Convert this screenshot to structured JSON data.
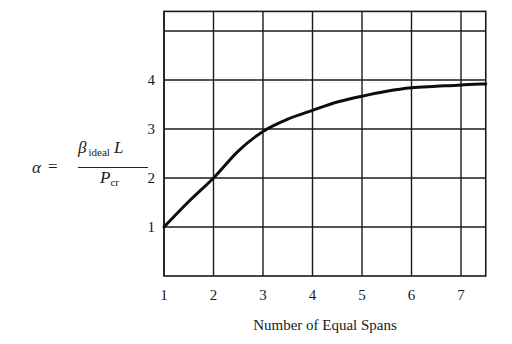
{
  "chart_data": {
    "type": "line",
    "title": "",
    "xlabel": "Number of Equal Spans",
    "ylabel": "α = β_ideal L / P_cr",
    "ylabel_parts": {
      "alpha": "α",
      "equals": "=",
      "beta": "β",
      "beta_sub": "ideal",
      "L": "L",
      "P": "P",
      "P_sub": "cr"
    },
    "x_ticks": [
      1,
      2,
      3,
      4,
      5,
      6,
      7
    ],
    "y_ticks": [
      1,
      2,
      3,
      4
    ],
    "y_gridlines": [
      1,
      2,
      3,
      4,
      5
    ],
    "x_gridlines": [
      1,
      2,
      3,
      4,
      5,
      6,
      7
    ],
    "xlim": [
      1,
      7.5
    ],
    "ylim": [
      0,
      5.4
    ],
    "grid": true,
    "legend": null,
    "series": [
      {
        "name": "alpha",
        "x": [
          1,
          1.5,
          2,
          2.5,
          3,
          3.5,
          4,
          4.5,
          5,
          5.5,
          6,
          6.5,
          7,
          7.5
        ],
        "y": [
          1.0,
          1.52,
          2.0,
          2.55,
          2.95,
          3.2,
          3.38,
          3.55,
          3.67,
          3.77,
          3.84,
          3.87,
          3.9,
          3.92
        ]
      }
    ]
  }
}
